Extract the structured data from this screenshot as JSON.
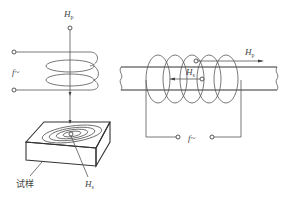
{
  "diagram": {
    "left_panel": {
      "primary_field_label": "H",
      "primary_field_sub": "p",
      "source_label": "f~",
      "secondary_field_label": "H",
      "secondary_field_sub": "s",
      "specimen_label": "试样"
    },
    "right_panel": {
      "primary_field_label": "H",
      "primary_field_sub": "p",
      "secondary_field_label": "H",
      "secondary_field_sub": "s",
      "source_label": "f~"
    },
    "colors": {
      "line": "#555555",
      "text": "#444444",
      "background": "#ffffff"
    }
  }
}
